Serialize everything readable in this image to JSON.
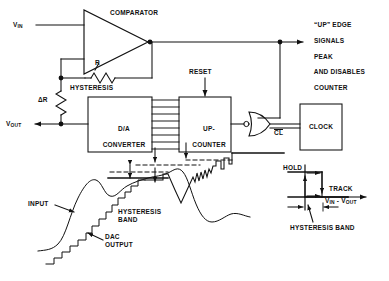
{
  "figure": {
    "type": "schematic-and-waveform"
  },
  "schematic": {
    "signals": {
      "vin_label_main": "V",
      "vin_label_sub": "IN",
      "vout_label_main": "V",
      "vout_label_sub": "OUT"
    },
    "blocks": [
      {
        "id": "comparator",
        "label": "COMPARATOR",
        "shape": "triangle"
      },
      {
        "id": "dac",
        "label_line1": "D/A",
        "label_line2": "CONVERTER",
        "shape": "rect"
      },
      {
        "id": "counter",
        "label_line1": "UP-",
        "label_line2": "COUNTER",
        "shape": "rect"
      },
      {
        "id": "clock",
        "label": "CLOCK",
        "shape": "rect"
      },
      {
        "id": "gate",
        "label": "",
        "shape": "or-gate-inverted-input"
      }
    ],
    "components": [
      {
        "id": "resistor-r",
        "label": "R",
        "caption": "HYSTERESIS",
        "orientation": "horizontal"
      },
      {
        "id": "resistor-delta-r",
        "label": "ΔR",
        "orientation": "vertical"
      }
    ],
    "inputs": [
      {
        "id": "reset",
        "label": "RESET"
      }
    ],
    "pin_labels": [
      {
        "id": "clock-cl",
        "label": "CL",
        "overbar": true
      }
    ],
    "annotations": [
      {
        "id": "up-edge-note",
        "lines": [
          "“UP” EDGE",
          "SIGNALS",
          "PEAK",
          "AND DISABLES",
          "COUNTER"
        ]
      }
    ]
  },
  "waveform_plot": {
    "labels": [
      {
        "id": "input",
        "text": "INPUT"
      },
      {
        "id": "dac-output",
        "text": "DAC\nOUTPUT"
      },
      {
        "id": "hysteresis-band",
        "text": "HYSTERESIS\nBAND"
      }
    ]
  },
  "transfer_plot": {
    "labels": [
      {
        "id": "hold",
        "text": "HOLD"
      },
      {
        "id": "track",
        "text": "TRACK"
      },
      {
        "id": "axis",
        "text_main_1": "V",
        "text_sub_1": "IN",
        "text_dash": " - ",
        "text_main_2": "V",
        "text_sub_2": "OUT"
      },
      {
        "id": "hysteresis-band",
        "text": "HYSTERESIS BAND"
      }
    ]
  },
  "colors": {
    "ink": "#111111",
    "background": "#ffffff"
  },
  "chart_data": {
    "type": "line",
    "panels": [
      {
        "name": "tracking-waveform",
        "xlabel": "time",
        "ylabel": "amplitude",
        "series": [
          {
            "name": "INPUT",
            "note": "smooth analog input; rises to a local peak, dips, rises to global peak, then decays with ripple"
          },
          {
            "name": "DAC OUTPUT",
            "note": "staircase output of D/A converter tracking the input, held within the hysteresis band"
          }
        ],
        "annotations": [
          "HYSTERESIS BAND",
          "INPUT",
          "DAC OUTPUT"
        ],
        "grid": false,
        "legend": "none"
      },
      {
        "name": "hysteresis-transfer",
        "xlabel": "VIN - VOUT",
        "ylabel": "comparator state",
        "states": [
          "HOLD",
          "TRACK"
        ],
        "note": "rectangular hysteresis loop; width of loop equals the hysteresis band",
        "annotations": [
          "HOLD",
          "TRACK",
          "HYSTERESIS BAND"
        ],
        "grid": false,
        "legend": "none"
      }
    ]
  }
}
